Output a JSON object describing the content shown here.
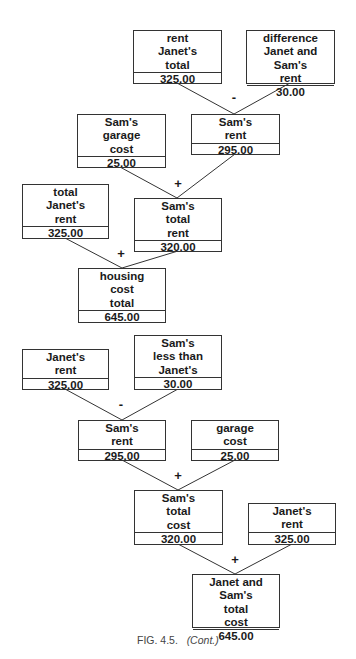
{
  "figure": {
    "caption_prefix": "FIG. 4.5.",
    "caption_suffix": "(Cont.)"
  },
  "diagram1": {
    "nodes": [
      {
        "id": "janet-total-rent",
        "lines": [
          "rent",
          "Janet's",
          "total"
        ],
        "value": "325.00"
      },
      {
        "id": "difference",
        "lines": [
          "difference",
          "Janet and Sam's",
          "rent"
        ],
        "value": "30.00"
      },
      {
        "id": "sams-garage-cost",
        "lines": [
          "Sam's",
          "garage",
          "cost"
        ],
        "value": "25.00"
      },
      {
        "id": "sams-rent",
        "lines": [
          "Sam's",
          "rent"
        ],
        "value": "295.00"
      },
      {
        "id": "total-janets-rent",
        "lines": [
          "total",
          "Janet's",
          "rent"
        ],
        "value": "325.00"
      },
      {
        "id": "sams-total-rent",
        "lines": [
          "Sam's",
          "total",
          "rent"
        ],
        "value": "320.00"
      },
      {
        "id": "housing-cost-total",
        "lines": [
          "housing",
          "cost",
          "total"
        ],
        "value": "645.00"
      }
    ],
    "operators": [
      "-",
      "+",
      "+"
    ]
  },
  "diagram2": {
    "nodes": [
      {
        "id": "janets-rent",
        "lines": [
          "Janet's",
          "rent"
        ],
        "value": "325.00"
      },
      {
        "id": "sams-less-than-janets",
        "lines": [
          "Sam's",
          "less than",
          "Janet's"
        ],
        "value": "30.00"
      },
      {
        "id": "sams-rent",
        "lines": [
          "Sam's",
          "rent"
        ],
        "value": "295.00"
      },
      {
        "id": "garage-cost",
        "lines": [
          "garage",
          "cost"
        ],
        "value": "25.00"
      },
      {
        "id": "sams-total-cost",
        "lines": [
          "Sam's",
          "total",
          "cost"
        ],
        "value": "320.00"
      },
      {
        "id": "janets-rent-2",
        "lines": [
          "Janet's",
          "rent"
        ],
        "value": "325.00"
      },
      {
        "id": "janet-and-sams-total-cost",
        "lines": [
          "Janet and Sam's",
          "total",
          "cost"
        ],
        "value": "645.00"
      }
    ],
    "operators": [
      "-",
      "+",
      "+"
    ]
  }
}
